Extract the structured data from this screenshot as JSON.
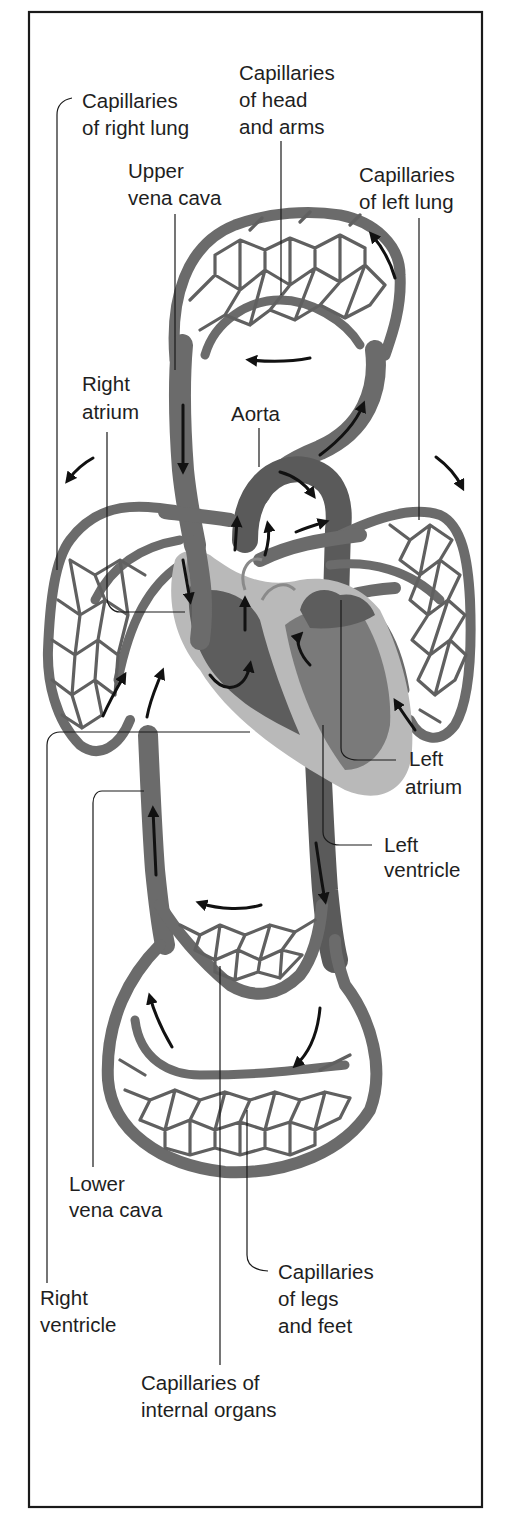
{
  "figure": {
    "type": "anatomical-diagram",
    "palette": {
      "vessel": "#6b6b6b",
      "vessel_dark": "#5a5a5a",
      "heart_light": "#b9b9b9",
      "arrow": "#111111",
      "label": "#1e1e1e",
      "frame": "#1a1a1a",
      "background": "#ffffff"
    }
  },
  "labels": {
    "cap_right_lung": {
      "line1": "Capillaries",
      "line2": "of right lung"
    },
    "cap_head_arms": {
      "line1": "Capillaries",
      "line2": "of head",
      "line3": "and arms"
    },
    "upper_vena_cava": {
      "line1": "Upper",
      "line2": "vena cava"
    },
    "cap_left_lung": {
      "line1": "Capillaries",
      "line2": "of left lung"
    },
    "right_atrium": {
      "line1": "Right",
      "line2": "atrium"
    },
    "aorta": {
      "line1": "Aorta"
    },
    "left_atrium": {
      "line1": "Left",
      "line2": "atrium"
    },
    "left_ventricle": {
      "line1": "Left",
      "line2": "ventricle"
    },
    "lower_vena_cava": {
      "line1": "Lower",
      "line2": "vena cava"
    },
    "cap_legs_feet": {
      "line1": "Capillaries",
      "line2": "of legs",
      "line3": "and feet"
    },
    "right_ventricle": {
      "line1": "Right",
      "line2": "ventricle"
    },
    "cap_internal_organs": {
      "line1": "Capillaries of",
      "line2": "internal organs"
    }
  },
  "flow_arrows": [
    "head-arms-capillaries-counterclockwise-top-right",
    "head-arms-return-leftward",
    "upper-vena-cava-downward",
    "aorta-arch-upward-right",
    "aorta-arch-downward-right",
    "pulmonary-to-right-lung-left",
    "pulmonary-to-left-lung-right",
    "right-lung-return-upward",
    "left-lung-return-upward-left",
    "heart-internal-flows",
    "descending-aorta-downward",
    "lower-vena-cava-upward",
    "internal-organs-return-leftward",
    "legs-return-upward-left",
    "legs-supply-downward-right"
  ]
}
